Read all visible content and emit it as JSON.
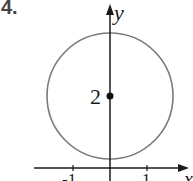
{
  "problem_number": "4.",
  "axes": {
    "x_label": "x",
    "y_label": "y",
    "x_ticks": [
      "-1",
      "1"
    ]
  },
  "figure": {
    "type": "circle",
    "center": [
      0,
      2
    ],
    "center_label": "2",
    "radius": 1.7,
    "stroke_color": "#7a7a7a",
    "axis_color": "#1a1a1a"
  }
}
